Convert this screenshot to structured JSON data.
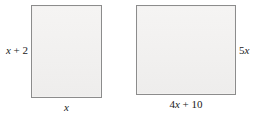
{
  "figure": {
    "background_color": "#ffffff",
    "shape_fill_color": "#f2f1f0",
    "shape_border_color": "#8c8c8c",
    "shapes": [
      {
        "name": "rectangle-a",
        "type": "rectangle",
        "labels": {
          "height": "x + 2",
          "height_position": "left",
          "width": "x",
          "width_position": "bottom"
        }
      },
      {
        "name": "rectangle-b",
        "type": "rectangle",
        "labels": {
          "height": "5x",
          "height_position": "right",
          "width": "4x + 10",
          "width_position": "bottom"
        }
      }
    ]
  },
  "labels": {
    "a_height": "x + 2",
    "a_width": "x",
    "b_height": "5x",
    "b_width": "4x + 10"
  }
}
